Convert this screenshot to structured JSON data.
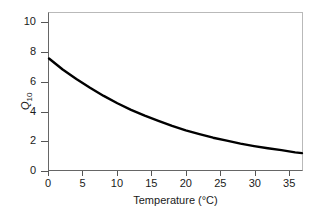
{
  "chart_data": {
    "type": "line",
    "title": "",
    "xlabel": "Temperature (°C)",
    "ylabel": "Q10",
    "ylabel_base": "Q",
    "ylabel_sub": "10",
    "xlim": [
      0,
      37
    ],
    "ylim": [
      0,
      10.7
    ],
    "grid": false,
    "legend": "none",
    "xticks": [
      0,
      5,
      10,
      15,
      20,
      25,
      30,
      35
    ],
    "xtick_labels": [
      "0",
      "5",
      "10",
      "15",
      "20",
      "25",
      "30",
      "35"
    ],
    "yticks": [
      0,
      2,
      4,
      6,
      8,
      10
    ],
    "ytick_labels": [
      "0",
      "2",
      "4",
      "6",
      "8",
      "10"
    ],
    "series": [
      {
        "name": "Q10 vs Temperature",
        "color": "#000000",
        "linewidth": 2.2,
        "x": [
          0,
          2,
          4,
          6,
          8,
          10,
          12,
          14,
          16,
          18,
          20,
          22,
          24,
          26,
          28,
          30,
          32,
          34,
          36,
          37
        ],
        "values": [
          7.6,
          6.85,
          6.2,
          5.6,
          5.05,
          4.55,
          4.1,
          3.7,
          3.35,
          3.0,
          2.7,
          2.45,
          2.2,
          2.0,
          1.8,
          1.63,
          1.48,
          1.35,
          1.2,
          1.15
        ]
      }
    ]
  },
  "axes": {
    "x_title": "Temperature (°C)",
    "y_title_base": "Q",
    "y_title_sub": "10"
  },
  "colors": {
    "curve": "#000000",
    "axis_dark": "#666666",
    "axis_light": "#b9b9b9",
    "text": "#1a1a1a",
    "background": "#ffffff"
  }
}
